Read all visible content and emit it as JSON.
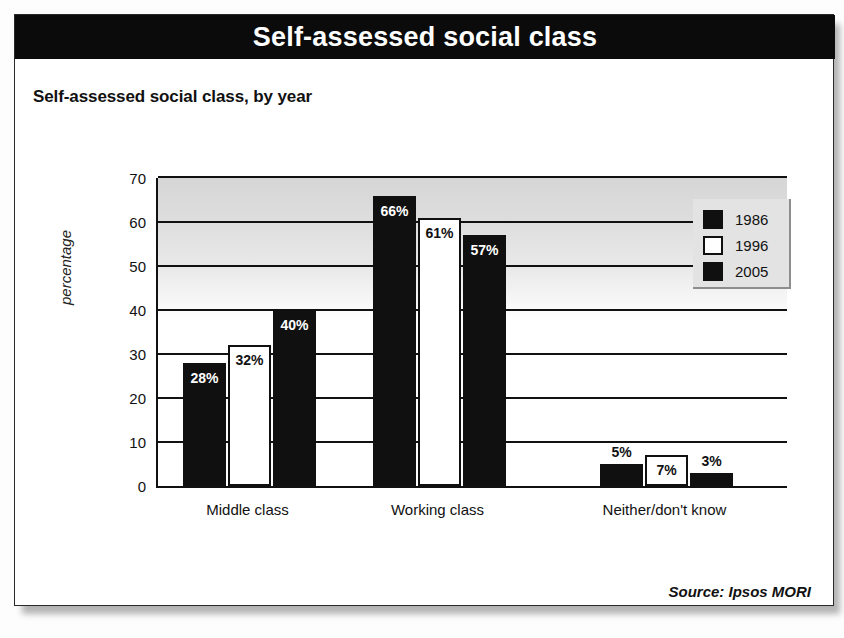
{
  "banner": {
    "title": "Self-assessed social class"
  },
  "subtitle": "Self-assessed social class, by year",
  "source": "Source: Ipsos MORI",
  "legend": {
    "entries": [
      {
        "label": "1986",
        "swatch": "dark"
      },
      {
        "label": "1996",
        "swatch": "light"
      },
      {
        "label": "2005",
        "swatch": "dark"
      }
    ]
  },
  "colors": {
    "banner_bg": "#0b0b0b",
    "banner_text": "#ffffff",
    "bar_dark": "#101010",
    "bar_light": "#ffffff",
    "axis": "#111111",
    "legend_bg": "#e3e3e3",
    "plot_gradient_top": "#d6d6d6",
    "plot_gradient_bottom": "#ffffff"
  },
  "chart_data": {
    "type": "bar",
    "title": "Self-assessed social class, by year",
    "xlabel": "",
    "ylabel": "percentage",
    "ylim": [
      0,
      70
    ],
    "yticks": [
      0,
      10,
      20,
      30,
      40,
      50,
      60,
      70
    ],
    "grid": true,
    "legend_position": "top-right",
    "categories": [
      "Middle class",
      "Working class",
      "Neither/don't know"
    ],
    "series": [
      {
        "name": "1986",
        "values": [
          28,
          66,
          5
        ],
        "labels": [
          "28%",
          "66%",
          "5%"
        ]
      },
      {
        "name": "1996",
        "values": [
          32,
          61,
          7
        ],
        "labels": [
          "32%",
          "61%",
          "7%"
        ]
      },
      {
        "name": "2005",
        "values": [
          40,
          57,
          3
        ],
        "labels": [
          "40%",
          "57%",
          "3%"
        ]
      }
    ]
  }
}
